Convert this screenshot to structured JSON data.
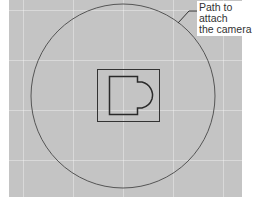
{
  "viewport": {
    "background": "#c4c4c4",
    "grid_color": "#e0e0e0"
  },
  "scene": {
    "camera_path": {
      "shape": "circle",
      "cx": 123,
      "cy": 96,
      "r": 92,
      "stroke": "#555555"
    },
    "outer_rect": {
      "x": 97,
      "y": 69,
      "width": 63,
      "height": 53
    },
    "floor_plan": {
      "shape": "room-with-apse",
      "stroke": "#333333"
    }
  },
  "annotation": {
    "line1": "Path to attach",
    "line2": "the camera"
  }
}
